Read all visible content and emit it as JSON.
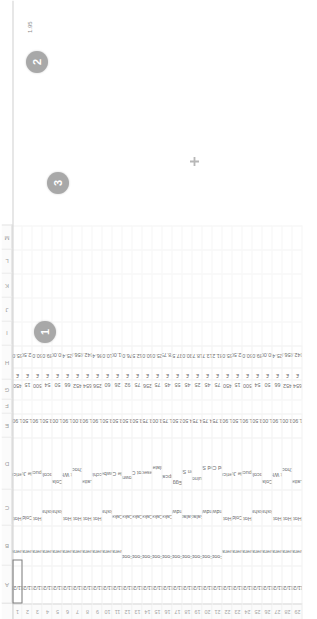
{
  "app": {
    "type": "spreadsheet",
    "orientation_degrees": -90
  },
  "grid": {
    "column_letters": [
      "A",
      "B",
      "C",
      "D",
      "E",
      "F",
      "G",
      "H",
      "I",
      "J",
      "K",
      "L",
      "M"
    ],
    "visible_row_numbers": [
      1,
      2,
      3,
      4,
      5,
      6,
      7,
      8,
      9,
      10,
      11,
      12,
      13,
      14,
      15,
      16,
      17,
      18,
      19,
      20,
      21,
      22,
      23,
      24,
      25,
      26,
      27,
      28,
      29,
      30
    ],
    "headers": [
      "Date",
      "Category",
      "Type",
      "Item",
      "Price",
      "",
      "Qty",
      "Total",
      "",
      "",
      "",
      "",
      ""
    ]
  },
  "table": {
    "columns": [
      "row",
      "date",
      "category",
      "type",
      "item",
      "blank_f",
      "qty",
      "currency",
      "total"
    ],
    "rows": [
      {
        "row": 1,
        "date": "17/11/2016",
        "category": "Beverage",
        "type": "Hot",
        "item": "Americano",
        "price": "1.90",
        "qty": "450",
        "currency": "£",
        "total": "855.00"
      },
      {
        "row": 2,
        "date": "17/11/2016",
        "category": "Beverage",
        "type": "Cold",
        "item": "Apple Juice",
        "price": "1.50",
        "qty": "15",
        "currency": "£",
        "total": "22.50"
      },
      {
        "row": 3,
        "date": "17/11/2016",
        "category": "Beverage",
        "type": "Hot",
        "item": "Cappuccino",
        "price": "1.90",
        "qty": "500",
        "currency": "£",
        "total": "950.00"
      },
      {
        "row": 4,
        "date": "17/11/2016",
        "category": "Beverage",
        "type": "Milkshake",
        "item": "Chocolate",
        "price": "3.50",
        "qty": "54",
        "currency": "£",
        "total": "189.00"
      },
      {
        "row": 5,
        "date": "17/11/2016",
        "category": "Beverage",
        "type": "Milkshake",
        "item": "Cola",
        "price": "1.00",
        "qty": "50",
        "currency": "£",
        "total": "50.00"
      },
      {
        "row": 6,
        "date": "17/11/2016",
        "category": "Beverage",
        "type": "Hot",
        "item": "Flat White",
        "price": "1.90",
        "qty": "66",
        "currency": "£",
        "total": "125.40"
      },
      {
        "row": 7,
        "date": "17/11/2016",
        "category": "Beverage",
        "type": "Hot",
        "item": "Hot Chocolate",
        "price": "3.00",
        "qty": "452",
        "currency": "£",
        "total": "1,356.00"
      },
      {
        "row": 8,
        "date": "17/11/2016",
        "category": "Beverage",
        "type": "Hot",
        "item": "Latte",
        "price": "1.90",
        "qty": "654",
        "currency": "£",
        "total": "1,242.60"
      },
      {
        "row": 9,
        "date": "17/11/2016",
        "category": "Beverage",
        "type": "Hot",
        "item": "Macchiato",
        "price": "1.90",
        "qty": "256",
        "currency": "£",
        "total": "486.40"
      },
      {
        "row": 10,
        "date": "17/11/2016",
        "category": "Beverage",
        "type": "Milkshake",
        "item": "Strawberry",
        "price": "3.50",
        "qty": "60",
        "currency": "£",
        "total": "210.00"
      },
      {
        "row": 11,
        "date": "17/11/2016",
        "category": "Beverage",
        "type": "Cake",
        "item": "Apple Cake",
        "price": "3.50",
        "qty": "26",
        "currency": "£",
        "total": "91.00"
      },
      {
        "row": 12,
        "date": "17/11/2016",
        "category": "Food",
        "type": "Cake",
        "item": "Brownie",
        "price": "3.50",
        "qty": "92",
        "currency": "£",
        "total": "276.00"
      },
      {
        "row": 13,
        "date": "17/11/2016",
        "category": "Food",
        "type": "Cake",
        "item": "Carrot Cake",
        "price": "3.50",
        "qty": "75",
        "currency": "£",
        "total": "262.50"
      },
      {
        "row": 14,
        "date": "17/11/2016",
        "category": "Food",
        "type": "Cake",
        "item": "Cheesecake",
        "price": "3.75",
        "qty": "256",
        "currency": "£",
        "total": "960.00"
      },
      {
        "row": 15,
        "date": "17/11/2016",
        "category": "Food",
        "type": "Cake",
        "item": "Chocolate Cake",
        "price": "3.00",
        "qty": "75",
        "currency": "£",
        "total": "225.00"
      },
      {
        "row": 16,
        "date": "17/11/2016",
        "category": "Food",
        "type": "Cake",
        "item": "Cupcake",
        "price": "1.75",
        "qty": "45",
        "currency": "£",
        "total": "78.75"
      },
      {
        "row": 17,
        "date": "17/11/2016",
        "category": "Food",
        "type": "Sandwich",
        "item": "Egg",
        "price": "2.50",
        "qty": "55",
        "currency": "£",
        "total": "137.50"
      },
      {
        "row": 18,
        "date": "17/11/2016",
        "category": "Food",
        "type": "Salad",
        "item": "Green Salad",
        "price": "4.50",
        "qty": "45",
        "currency": "£",
        "total": "130.00"
      },
      {
        "row": 19,
        "date": "17/11/2016",
        "category": "Food",
        "type": "Salad",
        "item": "Quinoa",
        "price": "4.75",
        "qty": "25",
        "currency": "£",
        "total": "118.75"
      },
      {
        "row": 20,
        "date": "17/11/2016",
        "category": "Food",
        "type": "Sandwich",
        "item": "Smoked Salmon",
        "price": "4.75",
        "qty": "45",
        "currency": "£",
        "total": "213.75"
      },
      {
        "row": 21,
        "date": "17/11/2016",
        "category": "Food",
        "type": "Sandwich",
        "item": "Toasted Cheese",
        "price": "3.75",
        "qty": "75",
        "currency": "£",
        "total": "281.25"
      },
      {
        "row": 22,
        "date": "18/11/2016",
        "category": "Beverage",
        "type": "Hot",
        "item": "Americano",
        "price": "1.90",
        "qty": "450",
        "currency": "£",
        "total": "855.00"
      },
      {
        "row": 23,
        "date": "18/11/2016",
        "category": "Beverage",
        "type": "Cold",
        "item": "Apple Juice",
        "price": "1.50",
        "qty": "15",
        "currency": "£",
        "total": "22.50"
      },
      {
        "row": 24,
        "date": "18/11/2016",
        "category": "Beverage",
        "type": "Hot",
        "item": "Cappuccino",
        "price": "1.90",
        "qty": "500",
        "currency": "£",
        "total": "950.00"
      },
      {
        "row": 25,
        "date": "18/11/2016",
        "category": "Beverage",
        "type": "Milkshake",
        "item": "Chocolate",
        "price": "3.50",
        "qty": "54",
        "currency": "£",
        "total": "189.00"
      },
      {
        "row": 26,
        "date": "18/11/2016",
        "category": "Beverage",
        "type": "Milkshake",
        "item": "Cola",
        "price": "1.00",
        "qty": "50",
        "currency": "£",
        "total": "50.00"
      },
      {
        "row": 27,
        "date": "18/11/2016",
        "category": "Beverage",
        "type": "Hot",
        "item": "Flat White",
        "price": "1.90",
        "qty": "66",
        "currency": "£",
        "total": "125.40"
      },
      {
        "row": 28,
        "date": "18/11/2016",
        "category": "Beverage",
        "type": "Hot",
        "item": "Hot Chocolate",
        "price": "3.00",
        "qty": "452",
        "currency": "£",
        "total": "1,356.00"
      },
      {
        "row": 29,
        "date": "18/11/2016",
        "category": "Beverage",
        "type": "Hot",
        "item": "Latte",
        "price": "1.90",
        "qty": "654",
        "currency": "£",
        "total": "1,242.60"
      }
    ]
  },
  "annotations": {
    "badges": [
      {
        "label": "1"
      },
      {
        "label": "2"
      },
      {
        "label": "3"
      }
    ],
    "float_value": "1.95"
  },
  "colors": {
    "badge": "#9a9a9a",
    "grid_line": "#efefef",
    "header_text": "#9b9b9b",
    "cell_text": "#6f6f6f"
  }
}
